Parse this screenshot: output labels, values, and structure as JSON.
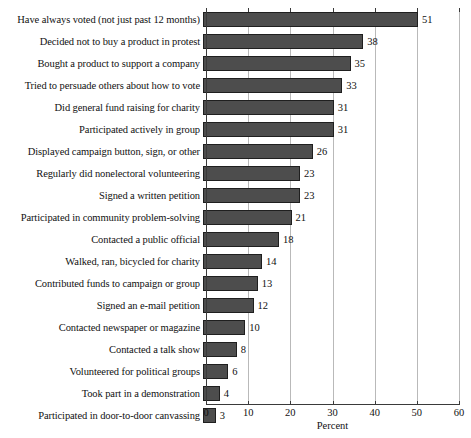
{
  "chart_data": {
    "type": "bar",
    "orientation": "horizontal",
    "title": "",
    "xlabel": "Percent",
    "ylabel": "",
    "xlim": [
      0,
      60
    ],
    "xticks": [
      0,
      10,
      20,
      30,
      40,
      50,
      60
    ],
    "grid": true,
    "legend": false,
    "bar_color": "#4d4d4d",
    "bar_edge_color": "#1f1f1f",
    "categories": [
      "Have always voted (not just past 12 months)",
      "Decided not to buy a product in protest",
      "Bought a product to support a company",
      "Tried to persuade others about how to vote",
      "Did general fund raising for charity",
      "Participated actively in group",
      "Displayed campaign button, sign, or other",
      "Regularly did nonelectoral volunteering",
      "Signed a written petition",
      "Participated in community problem-solving",
      "Contacted a public official",
      "Walked, ran, bicycled for charity",
      "Contributed funds to campaign or group",
      "Signed an e-mail petition",
      "Contacted newspaper or magazine",
      "Contacted a talk show",
      "Volunteered for political groups",
      "Took part in a demonstration",
      "Participated in door-to-door canvassing"
    ],
    "values": [
      51,
      38,
      35,
      33,
      31,
      31,
      26,
      23,
      23,
      21,
      18,
      14,
      13,
      12,
      10,
      8,
      6,
      4,
      3
    ],
    "value_labels": [
      "51",
      "38",
      "35",
      "33",
      "31",
      "31",
      "26",
      "23",
      "23",
      "21",
      "18",
      "14",
      "13",
      "12",
      "10",
      "8",
      "6",
      "4",
      "3"
    ],
    "tick_labels": [
      "0",
      "10",
      "20",
      "30",
      "40",
      "50",
      "60"
    ]
  }
}
